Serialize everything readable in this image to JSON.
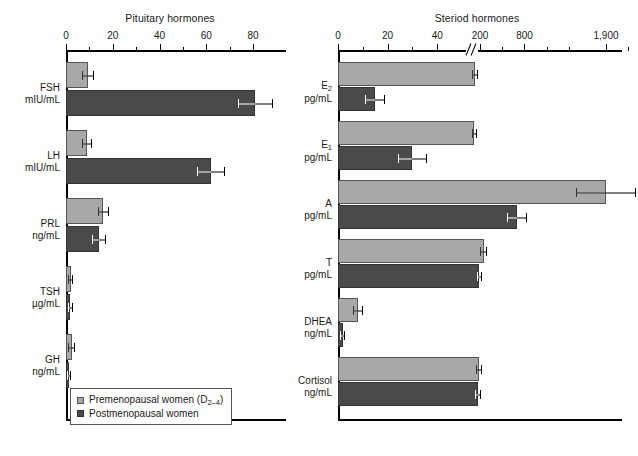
{
  "figure": {
    "background": "#ffffff",
    "color_premenopausal": "#a8a8a8",
    "color_postmenopausal": "#4a4a4a"
  },
  "legend": {
    "premenopausal_label": "Premenopausal women (D2–4)",
    "premenopausal_text_main": "Premenopausal women (D",
    "premenopausal_text_sub": "2–4",
    "premenopausal_text_tail": ")",
    "postmenopausal_label": "Postmenopausal women"
  },
  "chart_data": [
    {
      "id": "pituitary",
      "type": "bar",
      "orientation": "horizontal",
      "title": "Pituitary hormones",
      "xlabel": "",
      "ylabel": "",
      "xlim": [
        0,
        90
      ],
      "grid": false,
      "legend_position": "bottom-left",
      "axis_break": false,
      "tick_labels": [
        "0",
        "20",
        "40",
        "60",
        "80"
      ],
      "tick_values": [
        0,
        20,
        40,
        60,
        80
      ],
      "minor_tick_values": [
        10,
        30,
        50,
        70
      ],
      "categories": [
        "FSH",
        "LH",
        "PRL",
        "TSH",
        "GH"
      ],
      "category_units": [
        "mIU/mL",
        "mIU/mL",
        "ng/mL",
        "µg/mL",
        "ng/mL"
      ],
      "series": [
        {
          "name": "Premenopausal women (D2–4)",
          "color": "#a8a8a8",
          "values": [
            9.5,
            9.0,
            16.0,
            2.0,
            2.5
          ],
          "errors": [
            2.5,
            2.0,
            2.5,
            1.2,
            1.5
          ]
        },
        {
          "name": "Postmenopausal women",
          "color": "#4a4a4a",
          "values": [
            81.0,
            62.0,
            14.0,
            1.8,
            1.2
          ],
          "errors": [
            7.5,
            6.0,
            3.0,
            1.0,
            0.8
          ]
        }
      ]
    },
    {
      "id": "steroid",
      "type": "bar",
      "orientation": "horizontal",
      "title": "Steriod hormones",
      "xlabel": "",
      "ylabel": "",
      "xlim": [
        0,
        2600
      ],
      "grid": false,
      "legend_position": "none",
      "axis_break": true,
      "axis_break_note": "linear 0-50, then break, then 200 / 800 / 1,900",
      "tick_labels": [
        "0",
        "20",
        "40",
        "200",
        "800",
        "1,900"
      ],
      "tick_values": [
        0,
        20,
        40,
        200,
        800,
        1900
      ],
      "minor_tick_values": [
        10,
        30,
        500,
        1100,
        1400,
        2200
      ],
      "categories": [
        "E2",
        "E1",
        "A",
        "T",
        "DHEA",
        "Cortisol"
      ],
      "category_labels_main": [
        "E",
        "E",
        "A",
        "T",
        "DHEA",
        "Cortisol"
      ],
      "category_labels_sub": [
        "2",
        "1",
        "",
        "",
        "",
        ""
      ],
      "category_units": [
        "pg/mL",
        "pg/mL",
        "pg/mL",
        "pg/mL",
        "ng/mL",
        "ng/mL"
      ],
      "series": [
        {
          "name": "Premenopausal women (D2–4)",
          "color": "#a8a8a8",
          "values": [
            130,
            125,
            1900,
            250,
            8.0,
            185
          ],
          "errors": [
            40,
            35,
            400,
            45,
            2.0,
            38
          ]
        },
        {
          "name": "Postmenopausal women",
          "color": "#4a4a4a",
          "values": [
            15,
            30,
            700,
            190,
            2.0,
            175
          ],
          "errors": [
            4,
            6,
            130,
            35,
            1.0,
            42
          ]
        }
      ]
    }
  ]
}
